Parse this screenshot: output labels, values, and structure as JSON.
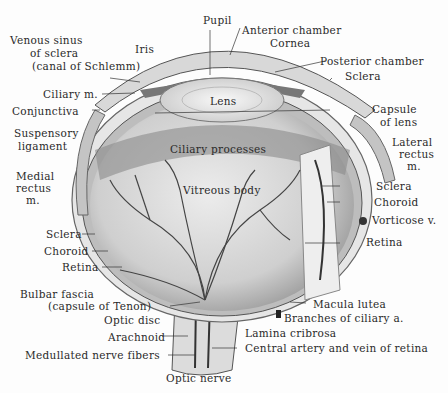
{
  "diagram": {
    "labels": {
      "pupil": "Pupil",
      "anterior_chamber": "Anterior chamber",
      "cornea": "Cornea",
      "posterior_chamber": "Posterior chamber",
      "sclera_top": "Sclera",
      "venous_sinus_1": "Venous sinus",
      "venous_sinus_2": "of sclera",
      "venous_sinus_3": "(canal of Schlemm)",
      "iris": "Iris",
      "ciliary_m": "Ciliary m.",
      "conjunctiva": "Conjunctiva",
      "suspensory_1": "Suspensory",
      "suspensory_2": "ligament",
      "lens": "Lens",
      "capsule_1": "Capsule",
      "capsule_2": "of lens",
      "lateral_1": "Lateral",
      "lateral_2": "rectus",
      "lateral_3": "m.",
      "ciliary_processes": "Ciliary processes",
      "medial_1": "Medial",
      "medial_2": "rectus",
      "medial_3": "m.",
      "vitreous_body": "Vitreous body",
      "sclera_right": "Sclera",
      "choroid_right": "Choroid",
      "vorticose": "Vorticose v.",
      "retina_right": "Retina",
      "sclera_left": "Sclera",
      "choroid_left": "Choroid",
      "retina_left": "Retina",
      "bulbar_1": "Bulbar fascia",
      "bulbar_2": "(capsule of Tenon)",
      "optic_disc": "Optic disc",
      "arachnoid": "Arachnoid",
      "medullated": "Medullated nerve fibers",
      "optic_nerve": "Optic nerve",
      "macula": "Macula lutea",
      "branches": "Branches of ciliary a.",
      "lamina": "Lamina cribrosa",
      "central": "Central artery and vein of retina"
    },
    "colors": {
      "ink": "#2a2a2a",
      "vitreous": "#d9d9d9",
      "sclera": "#eeeeee",
      "vessel": "#444444"
    }
  }
}
